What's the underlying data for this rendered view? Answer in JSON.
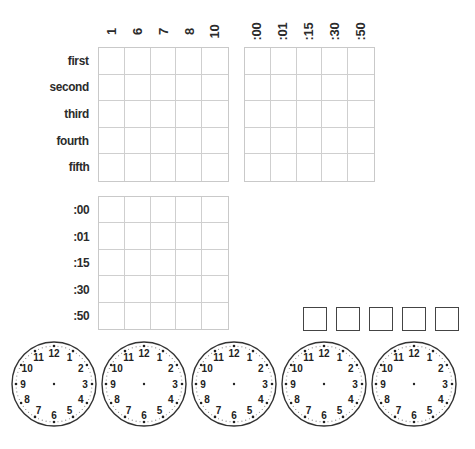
{
  "worksheet": {
    "grid_top_left": {
      "column_headers": [
        "1",
        "6",
        "7",
        "8",
        "10"
      ],
      "row_labels": [
        "first",
        "second",
        "third",
        "fourth",
        "fifth"
      ]
    },
    "grid_top_right": {
      "column_headers": [
        ":00",
        ":01",
        ":15",
        ":30",
        ":50"
      ]
    },
    "grid_bottom_left": {
      "row_labels": [
        ":00",
        ":01",
        ":15",
        ":30",
        ":50"
      ]
    },
    "answer_boxes_count": 5,
    "clocks": {
      "count": 5,
      "numerals": [
        "12",
        "1",
        "2",
        "3",
        "4",
        "5",
        "6",
        "7",
        "8",
        "9",
        "10",
        "11"
      ]
    },
    "footer": {
      "text": " "
    },
    "colors": {
      "grid_line": "#cfcfcf",
      "text": "#2b2b2b",
      "clock_outline": "#333333"
    }
  }
}
